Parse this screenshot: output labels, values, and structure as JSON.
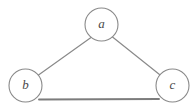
{
  "figure": {
    "background_color": "#ffffff",
    "stroke_color": "#8a8a8a",
    "label_color": "#4a4a4a"
  },
  "graph": {
    "type": "undirected-graph",
    "node_count": 3,
    "edge_count": 3,
    "nodes": [
      {
        "id": "a",
        "label": "a",
        "cx": 101.5,
        "cy": 24.5,
        "r": 16.5
      },
      {
        "id": "b",
        "label": "b",
        "cx": 25.5,
        "cy": 85.5,
        "r": 16.5
      },
      {
        "id": "c",
        "label": "c",
        "cx": 172.5,
        "cy": 85.5,
        "r": 16.5
      }
    ],
    "edges": [
      {
        "id": "edge-a-b",
        "from": "a",
        "to": "b",
        "x1": 91.0,
        "y1": 37.5,
        "x2": 38.5,
        "y2": 75.0,
        "weight": "thin"
      },
      {
        "id": "edge-a-c",
        "from": "a",
        "to": "c",
        "x1": 112.5,
        "y1": 37.0,
        "x2": 159.5,
        "y2": 74.5,
        "weight": "thin"
      },
      {
        "id": "edge-b-c",
        "from": "b",
        "to": "c",
        "x1": 39.0,
        "y1": 99.5,
        "x2": 159.0,
        "y2": 99.0,
        "weight": "thick"
      }
    ]
  }
}
